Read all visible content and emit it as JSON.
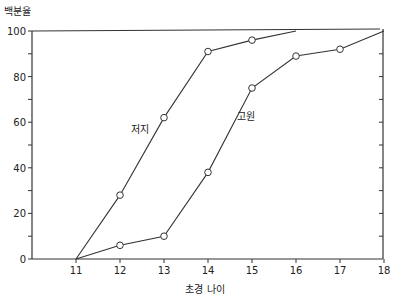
{
  "chart_data": {
    "type": "line",
    "title": "",
    "xlabel": "초경 나이",
    "ylabel": "백분율",
    "x": [
      11,
      12,
      13,
      14,
      15,
      16,
      17,
      18
    ],
    "xlim": [
      10,
      18
    ],
    "ylim": [
      0,
      100
    ],
    "x_ticks": [
      "11",
      "12",
      "13",
      "14",
      "15",
      "16",
      "17",
      "18"
    ],
    "y_ticks": [
      "0",
      "20",
      "40",
      "60",
      "80",
      "100"
    ],
    "grid": false,
    "legend": "inline labels",
    "series": [
      {
        "name": "저지",
        "label_pos": [
          140,
          129
        ],
        "points": [
          [
            11,
            0
          ],
          [
            12,
            28
          ],
          [
            13,
            62
          ],
          [
            14,
            91
          ],
          [
            15,
            96
          ],
          [
            16,
            100
          ]
        ],
        "markers": [
          false,
          true,
          true,
          true,
          true,
          false
        ]
      },
      {
        "name": "고원",
        "label_pos": [
          246,
          116
        ],
        "points": [
          [
            11,
            0
          ],
          [
            12,
            6
          ],
          [
            13,
            10
          ],
          [
            14,
            38
          ],
          [
            15,
            75
          ],
          [
            16,
            89
          ],
          [
            17,
            92
          ],
          [
            18,
            100
          ]
        ],
        "markers": [
          false,
          true,
          true,
          true,
          true,
          true,
          true,
          false
        ]
      }
    ]
  }
}
